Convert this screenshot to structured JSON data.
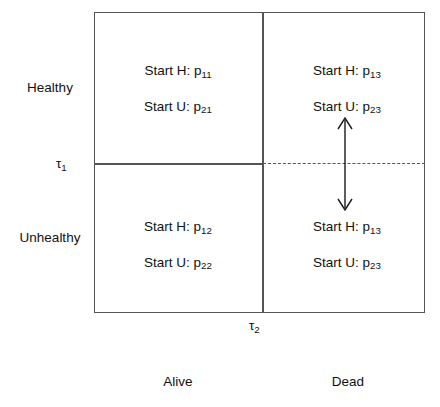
{
  "figure": {
    "axes": {
      "row_labels": [
        "Healthy",
        "Unhealthy"
      ],
      "column_labels": [
        "Alive",
        "Dead"
      ],
      "thresholds": {
        "tau_1": "τ",
        "tau_1_sub": "1",
        "tau_2": "τ",
        "tau_2_sub": "2"
      }
    },
    "quadrants": {
      "top_left": {
        "start_h_label": "Start H: p",
        "start_h_sub": "11",
        "start_u_label": "Start U: p",
        "start_u_sub": "21"
      },
      "top_right": {
        "start_h_label": "Start H: p",
        "start_h_sub": "13",
        "start_u_label": "Start U: p",
        "start_u_sub": "23"
      },
      "bottom_left": {
        "start_h_label": "Start H: p",
        "start_h_sub": "12",
        "start_u_label": "Start U: p",
        "start_u_sub": "22"
      },
      "bottom_right": {
        "start_h_label": "Start H: p",
        "start_h_sub": "13",
        "start_u_label": "Start U: p",
        "start_u_sub": "23"
      }
    },
    "colors": {
      "line": "#555555",
      "text": "#111111",
      "background": "#ffffff"
    }
  }
}
